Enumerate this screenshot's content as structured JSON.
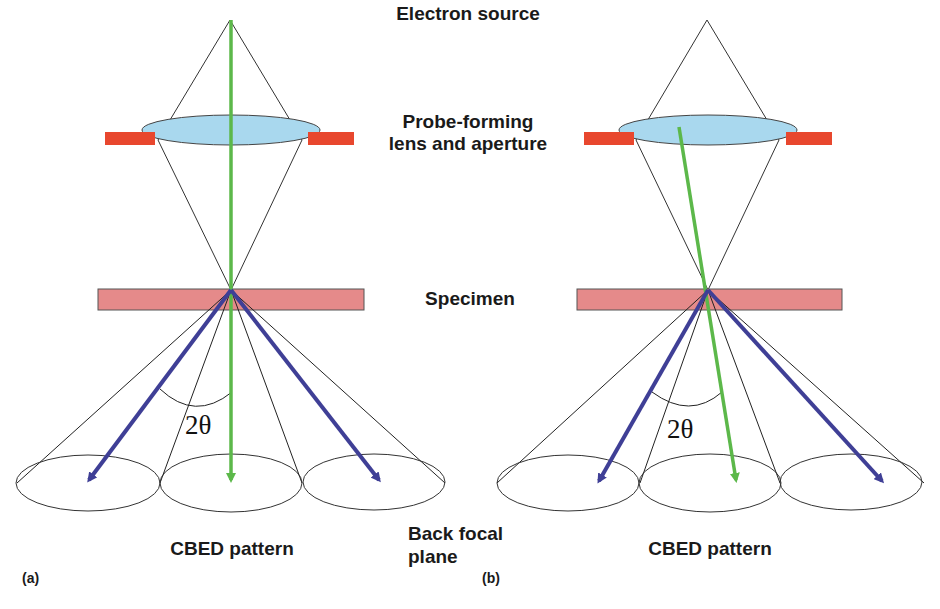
{
  "labels": {
    "electron_source": "Electron source",
    "probe_lens_line1": "Probe-forming",
    "probe_lens_line2": "lens and aperture",
    "specimen": "Specimen",
    "back_focal_line1": "Back focal",
    "back_focal_line2": "plane",
    "cbed_left": "CBED pattern",
    "cbed_right": "CBED pattern",
    "panel_a": "(a)",
    "panel_b": "(b)",
    "angle_left": "2θ",
    "angle_right": "2θ"
  },
  "colors": {
    "beam_green": "#5cb84a",
    "diffracted_blue": "#3f3f96",
    "lens_fill": "#a9d8ee",
    "aperture_red": "#e8472e",
    "specimen_fill": "#e58a8a",
    "outline": "#333333"
  },
  "panels": [
    {
      "id": "a",
      "description": "Parallel incident beam along optic axis; transmitted beam vertical"
    },
    {
      "id": "b",
      "description": "Tilted incident beam; transmitted beam deflected"
    }
  ]
}
